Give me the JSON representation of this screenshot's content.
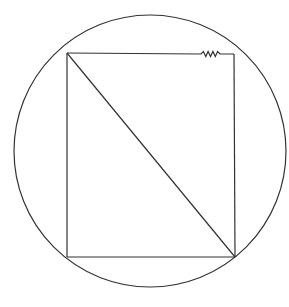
{
  "diagram": {
    "title": "",
    "canvas": {
      "width": 289,
      "height": 307,
      "background": "#ffffff"
    },
    "stroke_color": "#333333",
    "circle": {
      "cx": 150,
      "cy": 151,
      "r": 136
    },
    "rectangle": {
      "corners": {
        "top_left": [
          67,
          53
        ],
        "top_right": [
          234,
          54
        ],
        "bottom_right": [
          235,
          257
        ],
        "bottom_left": [
          67,
          257
        ]
      }
    },
    "diagonal": {
      "from": "top_left",
      "to": "bottom_right"
    },
    "zigzag_break": {
      "location": "top_edge",
      "x_start": 201,
      "x_end": 220,
      "y": 54
    }
  }
}
